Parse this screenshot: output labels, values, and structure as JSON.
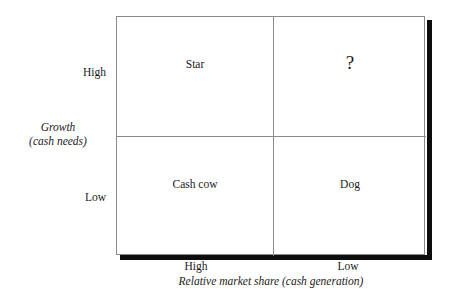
{
  "chart_data": {
    "type": "matrix",
    "title": "",
    "xlabel": "Relative market share (cash generation)",
    "ylabel": "Growth (cash needs)",
    "x_ticks": [
      "High",
      "Low"
    ],
    "y_ticks": [
      "High",
      "Low"
    ],
    "grid": true,
    "legend": "none",
    "cells": [
      {
        "row": "High",
        "col": "High",
        "label": "Star"
      },
      {
        "row": "High",
        "col": "Low",
        "label": "?"
      },
      {
        "row": "Low",
        "col": "High",
        "label": "Cash cow"
      },
      {
        "row": "Low",
        "col": "Low",
        "label": "Dog"
      }
    ]
  },
  "axes": {
    "y": {
      "title_line1": "Growth",
      "title_line2": "(cash needs)",
      "tick_high": "High",
      "tick_low": "Low"
    },
    "x": {
      "title": "Relative market share (cash generation)",
      "tick_high": "High",
      "tick_low": "Low"
    }
  },
  "quadrants": {
    "top_left": "Star",
    "top_right": "?",
    "bottom_left": "Cash cow",
    "bottom_right": "Dog"
  },
  "colors": {
    "frame_line": "#8a8a8a",
    "shadow": "#0d0d0d",
    "text": "#1a1a1a",
    "background": "#ffffff"
  }
}
